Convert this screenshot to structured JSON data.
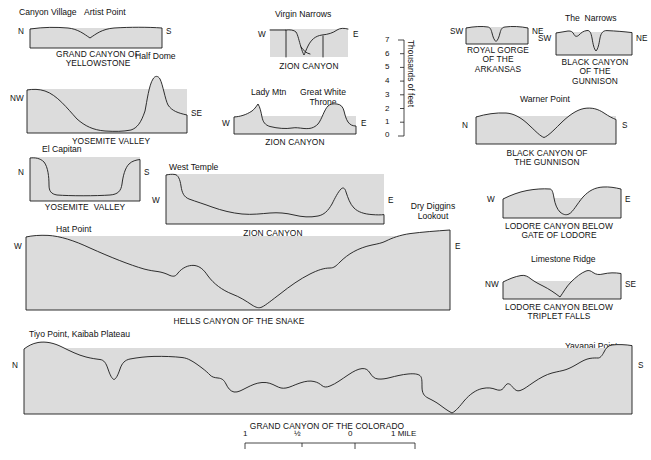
{
  "axis": {
    "label": "Thousands of feet",
    "ticks": [
      "7",
      "6",
      "5",
      "4",
      "3",
      "2",
      "1",
      "0"
    ],
    "min": 0,
    "max": 7
  },
  "scalebar": {
    "ticks": [
      "1",
      "½",
      "0",
      "1 MILE"
    ]
  },
  "profiles": [
    {
      "id": "grand-canyon-of-the-yellowstone",
      "caption": "GRAND CANYON OF\nYELLOWSTONE",
      "left_dir": "N",
      "right_dir": "S",
      "points": [
        "Canyon Village",
        "Artist Point"
      ]
    },
    {
      "id": "yosemite-valley-half-dome",
      "caption": "YOSEMITE VALLEY",
      "left_dir": "NW",
      "right_dir": "SE",
      "points": [
        "Half Dome"
      ]
    },
    {
      "id": "yosemite-valley-el-capitan",
      "caption": "YOSEMITE  VALLEY",
      "left_dir": "N",
      "right_dir": "S",
      "points": [
        "El Capitan"
      ]
    },
    {
      "id": "zion-canyon-virgin-narrows",
      "caption": "ZION CANYON",
      "left_dir": "W",
      "right_dir": "E",
      "points": [
        "Virgin Narrows"
      ]
    },
    {
      "id": "zion-canyon-lady-mtn",
      "caption": "ZION CANYON",
      "left_dir": "W",
      "right_dir": "E",
      "points": [
        "Lady Mtn",
        "Great White\nThrone"
      ]
    },
    {
      "id": "zion-canyon-west-temple",
      "caption": "ZION CANYON",
      "left_dir": "W",
      "right_dir": "E",
      "points": [
        "West Temple",
        "Springdale",
        "The Watchman"
      ]
    },
    {
      "id": "royal-gorge-of-the-arkansas",
      "caption": "ROYAL GORGE\nOF THE\nARKANSAS",
      "left_dir": "SW",
      "right_dir": "NE",
      "points": []
    },
    {
      "id": "black-canyon-of-the-gunnison-narrows",
      "caption": "BLACK CANYON\nOF THE\nGUNNISON",
      "left_dir": "SW",
      "right_dir": "NE",
      "points": [
        "The  Narrows"
      ]
    },
    {
      "id": "black-canyon-of-the-gunnison-warner",
      "caption": "BLACK CANYON OF\nTHE GUNNISON",
      "left_dir": "N",
      "right_dir": "S",
      "points": [
        "Warner Point"
      ]
    },
    {
      "id": "lodore-canyon-gate-of-lodore",
      "caption": "LODORE CANYON BELOW\nGATE OF LODORE",
      "left_dir": "W",
      "right_dir": "E",
      "points": []
    },
    {
      "id": "lodore-canyon-triplet-falls",
      "caption": "LODORE CANYON BELOW\nTRIPLET FALLS",
      "left_dir": "NW",
      "right_dir": "SE",
      "points": [
        "Limestone Ridge"
      ]
    },
    {
      "id": "hells-canyon-of-the-snake",
      "caption": "HELLS CANYON OF THE SNAKE",
      "left_dir": "W",
      "right_dir": "E",
      "points": [
        "Hat Point",
        "Dry Diggins\nLookout"
      ]
    },
    {
      "id": "grand-canyon-of-the-colorado",
      "caption": "GRAND CANYON OF THE COLORADO",
      "left_dir": "N",
      "right_dir": "S",
      "points": [
        "Tiyo Point, Kaibab Plateau",
        "Cheops Pyramid",
        "Yavapai Point"
      ]
    }
  ]
}
